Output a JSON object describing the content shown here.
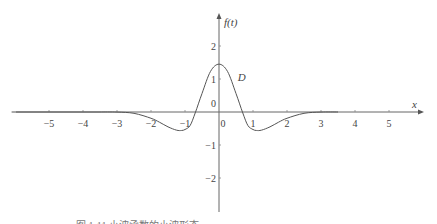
{
  "chart_data": {
    "type": "line",
    "title": "",
    "xlabel": "x",
    "ylabel": "f(t)",
    "xlim": [
      -6.0,
      6.0
    ],
    "ylim": [
      -3.2,
      2.8
    ],
    "x_ticks": [
      -5,
      -4,
      -3,
      -2,
      -1,
      0,
      1,
      2,
      3,
      4,
      5
    ],
    "x_tick_labels": [
      "−5",
      "−4",
      "−3",
      "−2",
      "−1",
      "0",
      "1",
      "2",
      "3",
      "4",
      "5"
    ],
    "y_ticks": [
      2,
      1,
      0,
      -1,
      -2
    ],
    "y_tick_labels": [
      "2",
      "1",
      "0",
      "−1",
      "−2"
    ],
    "grid": false,
    "series": [
      {
        "name": "f(t)",
        "description": "Mexican-hat shaped curve, approx 1.45·(1−2t²)·e^(−t²)",
        "x": [
          -3.5,
          -3,
          -2.5,
          -2,
          -1.75,
          -1.5,
          -1.25,
          -1.1,
          -1,
          -0.85,
          -0.7,
          -0.5,
          -0.25,
          0,
          0.25,
          0.5,
          0.7,
          0.85,
          1,
          1.1,
          1.25,
          1.5,
          1.75,
          2,
          2.5,
          3,
          3.5
        ],
        "y": [
          0.0,
          -0.002,
          -0.04,
          -0.19,
          -0.31,
          -0.45,
          -0.55,
          -0.56,
          -0.53,
          -0.41,
          -0.03,
          0.56,
          1.23,
          1.45,
          1.23,
          0.56,
          -0.03,
          -0.41,
          -0.53,
          -0.56,
          -0.55,
          -0.45,
          -0.31,
          -0.19,
          -0.04,
          -0.002,
          0.0
        ]
      }
    ],
    "annotations": [
      {
        "text": "D",
        "x": 0.55,
        "y": 0.95
      }
    ],
    "legend": "none"
  },
  "caption": "图 1-11  小波函数的小波形态"
}
